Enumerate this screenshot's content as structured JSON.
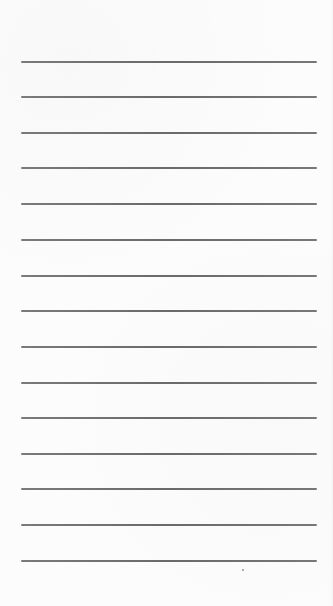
{
  "paper": {
    "background_color": "#fcfcfc",
    "line_color": "#6a6a6a",
    "line_count": 15,
    "line_left_px": 21,
    "line_right_px": 317,
    "first_line_y_px": 61,
    "line_spacing_px": 35.6
  },
  "lines": [
    {
      "y": 61
    },
    {
      "y": 96
    },
    {
      "y": 132
    },
    {
      "y": 167
    },
    {
      "y": 203
    },
    {
      "y": 239
    },
    {
      "y": 275
    },
    {
      "y": 310
    },
    {
      "y": 346
    },
    {
      "y": 382
    },
    {
      "y": 417
    },
    {
      "y": 453
    },
    {
      "y": 488
    },
    {
      "y": 524
    },
    {
      "y": 560
    }
  ],
  "specks": [
    {
      "x": 242,
      "y": 569
    }
  ]
}
